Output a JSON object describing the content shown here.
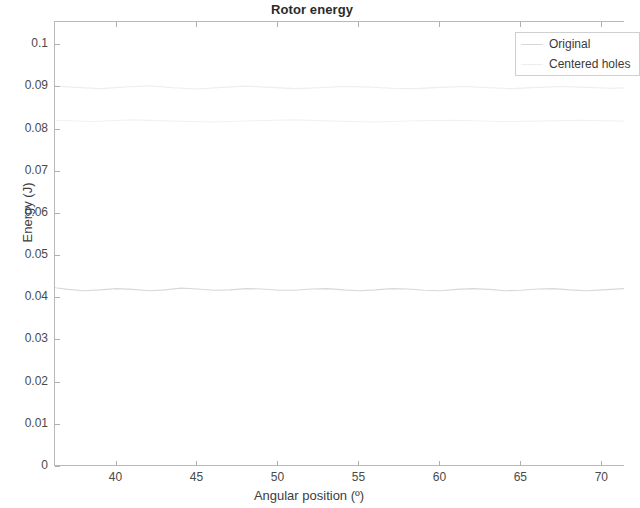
{
  "chart_data": {
    "type": "line",
    "title": "Rotor energy",
    "xlabel": "Angular position (º)",
    "ylabel": "Energy (J)",
    "xlim": [
      36.2,
      71.4
    ],
    "ylim": [
      0,
      0.1055
    ],
    "xticks": [
      40,
      45,
      50,
      55,
      60,
      65,
      70
    ],
    "xticklabels": [
      "40",
      "45",
      "50",
      "55",
      "60",
      "65",
      "70"
    ],
    "yticks": [
      0,
      0.01,
      0.02,
      0.03,
      0.04,
      0.05,
      0.06,
      0.07,
      0.08,
      0.09,
      0.1
    ],
    "yticklabels": [
      "0",
      "0.01",
      "0.02",
      "0.03",
      "0.04",
      "0.05",
      "0.06",
      "0.07",
      "0.08",
      "0.09",
      "0.1"
    ],
    "grid": false,
    "legend_position": "top-right",
    "series": [
      {
        "name": "Original",
        "color": "#d8d8d8",
        "x": [
          36.2,
          37.0,
          38.0,
          39.0,
          40.0,
          41.0,
          42.0,
          43.0,
          44.0,
          45.0,
          46.0,
          47.0,
          48.0,
          49.0,
          50.0,
          51.0,
          52.0,
          53.0,
          54.0,
          55.0,
          56.0,
          57.0,
          58.0,
          59.0,
          60.0,
          61.0,
          62.0,
          63.0,
          64.0,
          65.0,
          66.0,
          67.0,
          68.0,
          69.0,
          70.0,
          71.4
        ],
        "y": [
          0.0425,
          0.0421,
          0.0418,
          0.042,
          0.0423,
          0.0421,
          0.0418,
          0.042,
          0.0424,
          0.0422,
          0.0419,
          0.042,
          0.0423,
          0.0422,
          0.0419,
          0.0419,
          0.0422,
          0.0423,
          0.042,
          0.0418,
          0.042,
          0.0423,
          0.0422,
          0.0419,
          0.0418,
          0.0421,
          0.0423,
          0.0421,
          0.0418,
          0.0419,
          0.0422,
          0.0423,
          0.042,
          0.0418,
          0.042,
          0.0423
        ]
      },
      {
        "name": "Centered holes",
        "color": "#ededed",
        "x": [
          36.2,
          37.5,
          39.0,
          40.5,
          42.0,
          43.5,
          45.0,
          46.5,
          48.0,
          49.5,
          51.0,
          52.5,
          54.0,
          55.5,
          57.0,
          58.5,
          60.0,
          61.5,
          63.0,
          64.5,
          66.0,
          67.5,
          69.0,
          70.5,
          71.4
        ],
        "y": [
          0.0903,
          0.09,
          0.0897,
          0.0901,
          0.0904,
          0.0899,
          0.0896,
          0.09,
          0.0903,
          0.09,
          0.0897,
          0.0899,
          0.0902,
          0.0901,
          0.0898,
          0.0897,
          0.09,
          0.0902,
          0.0899,
          0.0897,
          0.09,
          0.0902,
          0.09,
          0.0898,
          0.0899
        ]
      },
      {
        "name": "faint-trace-lower",
        "color": "#f2f2f2",
        "x": [
          36.2,
          38.5,
          41.0,
          43.5,
          46.0,
          48.5,
          51.0,
          53.5,
          56.0,
          58.5,
          61.0,
          63.5,
          66.0,
          68.5,
          71.4
        ],
        "y": [
          0.0822,
          0.0819,
          0.0823,
          0.082,
          0.0818,
          0.0821,
          0.0823,
          0.082,
          0.0818,
          0.0821,
          0.0822,
          0.0819,
          0.082,
          0.0822,
          0.082
        ]
      }
    ]
  },
  "legend": {
    "entries": [
      {
        "label": "Original",
        "color": "#d8d8d8"
      },
      {
        "label": "Centered holes",
        "color": "#ededed"
      }
    ]
  }
}
